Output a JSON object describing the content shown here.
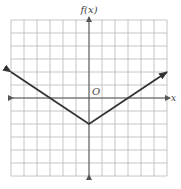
{
  "chart_data": {
    "type": "line",
    "title": "",
    "xlabel": "x",
    "ylabel": "f(x)",
    "origin_label": "O",
    "xlim": [
      -6,
      6
    ],
    "ylim": [
      -6,
      6
    ],
    "grid": true,
    "grid_step": 1,
    "function": "f(x) = (2/3)|x| - 2",
    "series": [
      {
        "name": "f(x)",
        "x": [
          -6,
          -3,
          0,
          3,
          6
        ],
        "y": [
          2,
          0,
          -2,
          0,
          2
        ],
        "arrows_at_ends": true
      }
    ],
    "vertex": [
      0,
      -2
    ],
    "x_intercepts": [
      -3,
      3
    ]
  },
  "colors": {
    "grid": "#b8b8b8",
    "axis": "#555555",
    "line": "#333333",
    "background": "#ffffff"
  }
}
